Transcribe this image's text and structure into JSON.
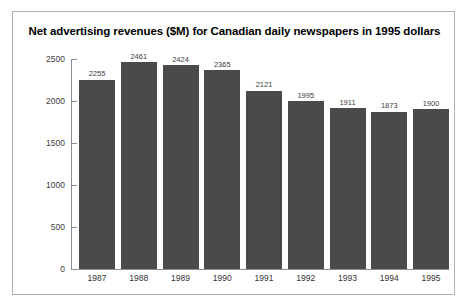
{
  "chart_data": {
    "type": "bar",
    "title": "Net advertising revenues ($M) for Canadian daily newspapers in 1995 dollars",
    "xlabel": "",
    "ylabel": "",
    "categories": [
      "1987",
      "1988",
      "1989",
      "1990",
      "1991",
      "1992",
      "1993",
      "1994",
      "1995"
    ],
    "values": [
      2255,
      2461,
      2424,
      2365,
      2121,
      1995,
      1911,
      1873,
      1900
    ],
    "value_labels": [
      "2255",
      "2461",
      "2424",
      "2365",
      "2121",
      "1995",
      "1911",
      "1873",
      "1900"
    ],
    "ylim": [
      0,
      2500
    ],
    "yticks": [
      0,
      500,
      1000,
      1500,
      2000,
      2500
    ],
    "ytick_labels": [
      "0",
      "500",
      "1000",
      "1500",
      "2000",
      "2500"
    ],
    "grid": false,
    "legend": "none",
    "bar_color": "#4a4a4a",
    "axis_color": "#8c8c8c",
    "border_color": "#b0b0b0",
    "background": "#ffffff"
  }
}
